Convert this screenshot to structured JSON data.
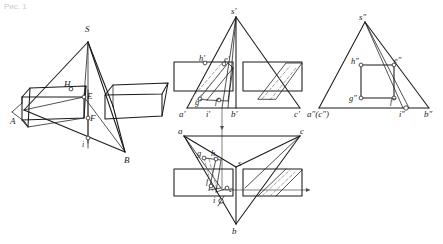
{
  "figure": {
    "title_faint": "Рис. 1",
    "domain": "descriptive-geometry-plate",
    "background_color": "#ffffff",
    "ink_color": "#1a1a1a",
    "hidden_line_color": "#8d8d8d"
  },
  "pictorial": {
    "caption": "axonometric view of pyramid S-AB cut by a rectangular prism",
    "labels": {
      "s": "S",
      "a": "A",
      "b": "B",
      "e": "E",
      "f": "F",
      "h": "H",
      "i": "i"
    }
  },
  "front_view": {
    "caption": "frontal projection",
    "labels": {
      "s": "s′",
      "a": "a′",
      "b": "b′",
      "c": "c′",
      "g": "g′",
      "h": "h′",
      "e": "e′",
      "f": "f′",
      "i": "i′"
    }
  },
  "side_view": {
    "caption": "profile projection",
    "labels": {
      "s": "s″",
      "ac": "a″(c″)",
      "b": "b″",
      "g": "g″",
      "h": "h″",
      "e": "e″",
      "f": "f″",
      "i": "i″"
    }
  },
  "top_view": {
    "caption": "horizontal projection",
    "labels": {
      "s": "s",
      "a": "a",
      "b": "b",
      "c": "c",
      "g": "g",
      "h": "h",
      "e": "e",
      "f": "f",
      "i": "i"
    }
  }
}
